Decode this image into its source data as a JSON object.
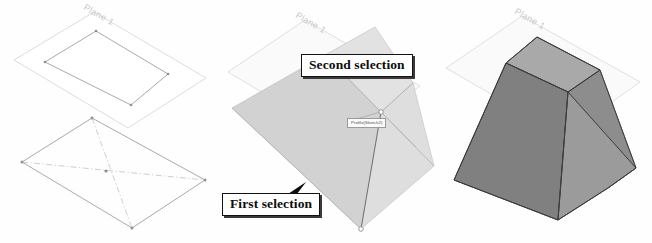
{
  "figure": {
    "panel_count": 3
  },
  "panels": [
    {
      "id": "panel-1",
      "name": "sketch-profiles",
      "description": "Two sketch profiles on offset planes",
      "plane_label": "Plane 1",
      "has_construction_lines": true
    },
    {
      "id": "panel-2",
      "name": "loft-preview-with-callouts",
      "description": "Loft preview with selected profiles",
      "plane_label": "Plane 1",
      "callouts": [
        {
          "name": "first-selection",
          "label": "First selection"
        },
        {
          "name": "second-selection",
          "label": "Second selection"
        }
      ],
      "tooltip": {
        "name": "profile-tooltip",
        "label": "Profile(Sketch2)"
      }
    },
    {
      "id": "panel-3",
      "name": "completed-loft-solid",
      "description": "Completed shaded loft solid",
      "plane_label": "Plane 1"
    }
  ],
  "colors": {
    "page_background": "#fefefe",
    "plane_fill": "#ffffff",
    "plane_stroke": "#d8d8d8",
    "plane_label_text": "#c9c9c9",
    "sketch_stroke": "#9f9f9f",
    "construction_stroke": "#b9b9b9",
    "vertex": "#8e8e8e",
    "preview_face_light": "#e0e0e0",
    "preview_face_mid": "#d2d2d2",
    "preview_face_dark": "#c9c9c9",
    "solid_face_top": "#a9a9a9",
    "solid_face_left": "#808080",
    "solid_face_right": "#9b9b9b",
    "solid_face_far": "#8d8d8d",
    "callout_border": "#121212",
    "callout_text": "#0d0d0d",
    "callout_background": "#ffffff",
    "tooltip_border": "#9a9a9a",
    "tooltip_text": "#4a4a4a"
  }
}
